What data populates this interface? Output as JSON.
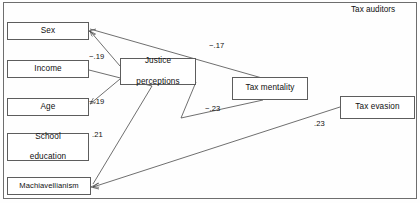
{
  "figure": {
    "title": "Tax auditors",
    "title_pos": {
      "x": 351,
      "y": 6
    }
  },
  "nodes": [
    {
      "id": "sex",
      "label": "Sex",
      "x": 7,
      "y": 22,
      "w": 82,
      "h": 18,
      "lines": [
        "Sex"
      ]
    },
    {
      "id": "income",
      "label": "Income",
      "x": 7,
      "y": 60,
      "w": 82,
      "h": 18,
      "lines": [
        "Income"
      ]
    },
    {
      "id": "age",
      "label": "Age",
      "x": 7,
      "y": 98,
      "w": 82,
      "h": 18,
      "lines": [
        "Age"
      ]
    },
    {
      "id": "school-education",
      "label": "School education",
      "x": 7,
      "y": 133,
      "w": 82,
      "h": 28,
      "lines": [
        "School",
        "education"
      ]
    },
    {
      "id": "machiavellianism",
      "label": "Machiavellianism",
      "x": 7,
      "y": 177,
      "w": 84,
      "h": 18,
      "lines": [
        "Machiavellianism"
      ]
    },
    {
      "id": "justice-perceptions",
      "label": "Justice perceptions",
      "x": 120,
      "y": 58,
      "w": 76,
      "h": 27,
      "lines": [
        "Justice",
        "perceptions"
      ]
    },
    {
      "id": "tax-mentality",
      "label": "Tax mentality",
      "x": 232,
      "y": 77,
      "w": 76,
      "h": 23,
      "lines": [
        "Tax mentality"
      ]
    },
    {
      "id": "tax-evasion",
      "label": "Tax evasion",
      "x": 340,
      "y": 96,
      "w": 75,
      "h": 23,
      "lines": [
        "Tax evasion"
      ]
    }
  ],
  "edges": [
    {
      "id": "justice-to-sex",
      "from": "justice-perceptions",
      "to": "sex",
      "coefficient": "−.19",
      "label_x": 89,
      "label_y": 53
    },
    {
      "id": "justice-to-age",
      "from": "justice-perceptions",
      "to": "age",
      "coefficient": "−.19",
      "label_x": 89,
      "label_y": 97
    },
    {
      "id": "machiavellianism-to-justice",
      "from": "machiavellianism",
      "to": "justice-perceptions",
      "coefficient": ".21",
      "label_x": 92,
      "label_y": 130
    },
    {
      "id": "sex-to-tax-mentality",
      "from": "sex",
      "to": "tax-mentality",
      "coefficient": "−.17",
      "label_x": 210,
      "label_y": 42
    },
    {
      "id": "justice-to-tax-mentality",
      "from": "justice-perceptions",
      "to": "tax-mentality",
      "coefficient": "−.23",
      "label_x": 205,
      "label_y": 104
    },
    {
      "id": "tax-evasion-to-machiavellianism",
      "from": "tax-evasion",
      "to": "machiavellianism",
      "coefficient": ".23",
      "label_x": 313,
      "label_y": 119
    }
  ],
  "paths": {
    "justice_to_sex": "M120,66 L89,31",
    "justice_to_age": "M120,78 L89,104",
    "income_to_justice": "M89,70 L150,85",
    "machiavellianism_to_justice": "M150,85 L92,184",
    "sex_to_tax_mentality": "M89,28 L260,77",
    "justice_to_tax_mentality": "M196,80 L181,117 L262,100",
    "tax_evasion_to_machiavellianism": "M340,108 L92,187"
  },
  "style": {
    "line_color": "#4a4a4a",
    "box_border": "#5d5d5d",
    "frame_border": "#6e6e6e",
    "text_color": "#101010",
    "background": "#fefefe"
  }
}
